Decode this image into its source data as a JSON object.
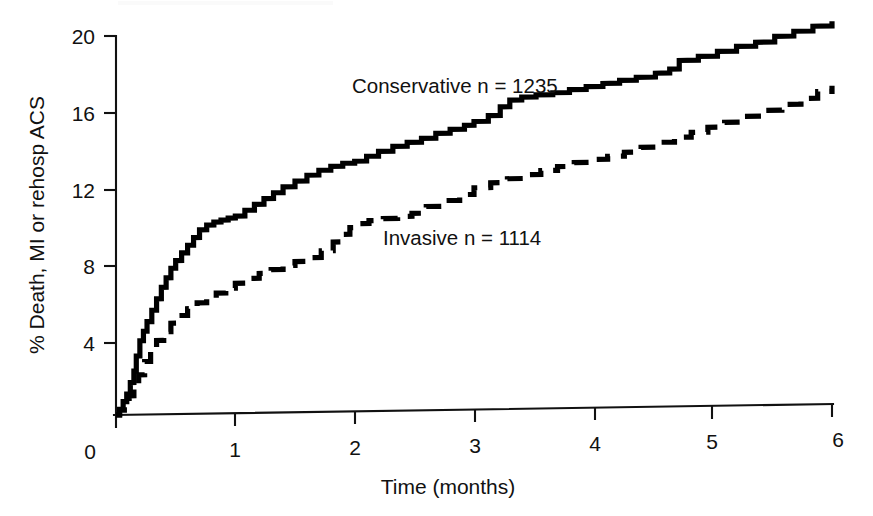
{
  "chart_data": {
    "type": "line",
    "title": "",
    "subtitle": "",
    "xlabel": "Time (months)",
    "ylabel": "% Death, MI or rehosp ACS",
    "xlim": [
      0,
      6
    ],
    "ylim": [
      0,
      20
    ],
    "xticks": [
      0,
      1,
      2,
      3,
      4,
      5,
      6
    ],
    "yticks": [
      0,
      4,
      8,
      12,
      16,
      20
    ],
    "xtick_labels": [
      "0",
      "1",
      "2",
      "3",
      "4",
      "5",
      "6"
    ],
    "ytick_labels": [
      "0",
      "4",
      "8",
      "12",
      "16",
      "20"
    ],
    "grid": false,
    "legend_position": "inline-annotation",
    "annotations": [
      {
        "text": "Conservative n = 1235",
        "x": 2.1,
        "y": 17.3
      },
      {
        "text": "Invasive n = 1114",
        "x": 3.0,
        "y": 9.6
      }
    ],
    "series": [
      {
        "name": "Conservative n = 1235",
        "label": "Conservative",
        "n": 1235,
        "style": "solid",
        "color": "#000000",
        "x": [
          0.0,
          0.03,
          0.06,
          0.09,
          0.12,
          0.15,
          0.17,
          0.2,
          0.23,
          0.26,
          0.3,
          0.34,
          0.38,
          0.42,
          0.46,
          0.5,
          0.55,
          0.6,
          0.65,
          0.7,
          0.76,
          0.82,
          0.88,
          0.94,
          1.0,
          1.08,
          1.16,
          1.24,
          1.32,
          1.4,
          1.5,
          1.6,
          1.7,
          1.8,
          1.9,
          2.0,
          2.1,
          2.2,
          2.32,
          2.44,
          2.56,
          2.68,
          2.8,
          2.92,
          3.0,
          3.12,
          3.22,
          3.3,
          3.4,
          3.52,
          3.66,
          3.8,
          3.94,
          4.08,
          4.22,
          4.36,
          4.52,
          4.64,
          4.72,
          4.88,
          5.04,
          5.2,
          5.36,
          5.52,
          5.68,
          5.84,
          6.0
        ],
        "y": [
          0.0,
          0.3,
          0.7,
          1.1,
          1.7,
          2.3,
          3.1,
          3.9,
          4.4,
          4.9,
          5.5,
          6.1,
          6.7,
          7.2,
          7.7,
          8.1,
          8.5,
          8.9,
          9.3,
          9.7,
          9.95,
          10.1,
          10.2,
          10.3,
          10.4,
          10.7,
          11.0,
          11.3,
          11.6,
          11.9,
          12.2,
          12.5,
          12.75,
          12.95,
          13.1,
          13.2,
          13.45,
          13.7,
          13.95,
          14.15,
          14.35,
          14.6,
          14.8,
          15.0,
          15.2,
          15.5,
          15.95,
          16.3,
          16.45,
          16.55,
          16.65,
          16.8,
          16.95,
          17.1,
          17.25,
          17.4,
          17.6,
          17.8,
          18.25,
          18.45,
          18.7,
          18.95,
          19.15,
          19.45,
          19.7,
          19.95,
          20.2
        ]
      },
      {
        "name": "Invasive n = 1114",
        "label": "Invasive",
        "n": 1114,
        "style": "dashed",
        "color": "#000000",
        "x": [
          0.0,
          0.03,
          0.07,
          0.11,
          0.15,
          0.19,
          0.24,
          0.29,
          0.34,
          0.4,
          0.46,
          0.53,
          0.6,
          0.68,
          0.76,
          0.84,
          0.92,
          1.0,
          1.1,
          1.2,
          1.3,
          1.4,
          1.5,
          1.6,
          1.72,
          1.82,
          1.9,
          1.96,
          2.02,
          2.12,
          2.24,
          2.36,
          2.48,
          2.6,
          2.74,
          2.88,
          3.0,
          3.14,
          3.28,
          3.42,
          3.56,
          3.7,
          3.84,
          3.98,
          4.12,
          4.26,
          4.4,
          4.54,
          4.68,
          4.82,
          4.96,
          5.1,
          5.26,
          5.42,
          5.58,
          5.74,
          5.88,
          6.0
        ],
        "y": [
          0.0,
          0.25,
          0.6,
          1.0,
          1.5,
          2.1,
          2.8,
          3.4,
          3.9,
          4.35,
          4.8,
          5.2,
          5.55,
          5.85,
          6.1,
          6.35,
          6.6,
          6.85,
          7.1,
          7.35,
          7.55,
          7.75,
          7.95,
          8.15,
          8.5,
          8.95,
          9.35,
          9.7,
          9.9,
          10.05,
          10.15,
          10.25,
          10.4,
          10.75,
          11.05,
          11.35,
          11.7,
          11.95,
          12.15,
          12.35,
          12.55,
          12.75,
          12.95,
          13.1,
          13.25,
          13.45,
          13.7,
          13.95,
          14.2,
          14.45,
          14.7,
          14.95,
          15.25,
          15.55,
          15.85,
          16.15,
          16.5,
          16.8
        ]
      }
    ]
  }
}
